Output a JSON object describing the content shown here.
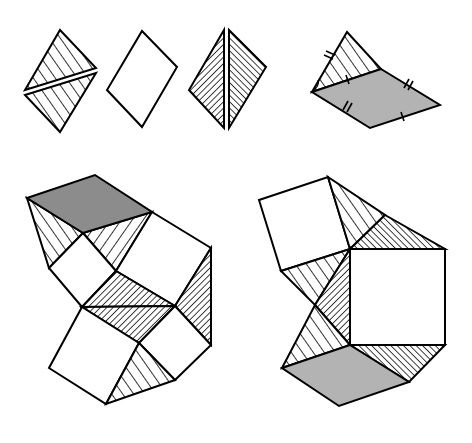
{
  "diagram": {
    "colors": {
      "stroke": "#000000",
      "background": "#ffffff",
      "light_gray": "#b3b3b3",
      "dark_gray": "#8c8c8c"
    },
    "top_row": [
      {
        "id": "split-hatched-rhombus",
        "fill": "wide-hatch",
        "parts": 2
      },
      {
        "id": "plain-rhombus",
        "fill": "white",
        "parts": 1
      },
      {
        "id": "split-dense-hatched-rhombus",
        "fill": "dense-hatch",
        "parts": 2
      },
      {
        "id": "folded-rhombus-with-triangle",
        "fill": "gray + wide-hatch",
        "tick_marks": {
          "double": 3,
          "single": 2
        }
      }
    ],
    "bottom_row": [
      {
        "id": "left-assembly",
        "pieces": [
          "dark-gray-rhombus",
          "hatched-triangles",
          "white-squares",
          "dense-hatched-quads"
        ]
      },
      {
        "id": "right-assembly",
        "pieces": [
          "white-squares",
          "hatched-triangles",
          "dense-hatched-triangles",
          "gray-rhombus"
        ]
      }
    ]
  }
}
